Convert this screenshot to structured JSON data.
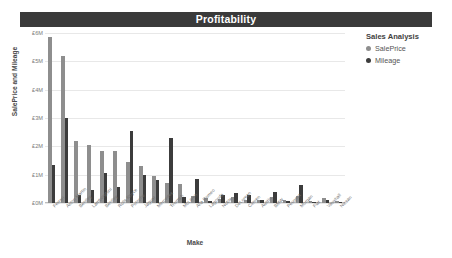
{
  "header": {
    "title": "Profitability",
    "bar_color": "#3a3a3a"
  },
  "legend": {
    "title": "Sales Analysis",
    "items": [
      {
        "label": "SalePrice",
        "color": "#8e8e8e",
        "marker": "circle-marker"
      },
      {
        "label": "Mileage",
        "color": "#3c3c3c",
        "marker": "circle-marker"
      }
    ]
  },
  "axes": {
    "x_title": "Make",
    "y_title": "SalePrice and Mileage",
    "y_ticks": [
      "£0M",
      "£1M",
      "£2M",
      "£3M",
      "£4M",
      "£5M",
      "£6M"
    ]
  },
  "chart_data": {
    "type": "bar",
    "title": "Profitability",
    "xlabel": "Make",
    "ylabel": "SalePrice and Mileage",
    "ylim": [
      0,
      6
    ],
    "y_tick_values": [
      0,
      1,
      2,
      3,
      4,
      5,
      6
    ],
    "y_tick_labels": [
      "£0M",
      "£1M",
      "£2M",
      "£3M",
      "£4M",
      "£5M",
      "£6M"
    ],
    "grid": true,
    "legend_position": "top-right",
    "legend_title": "Sales Analysis",
    "categories": [
      "Ferrari",
      "Aston Martin",
      "Bentley",
      "Lamborghini",
      "Bentley",
      "Rolls Royce",
      "Porsche",
      "Jaguar",
      "Mercedes",
      "Triumph",
      "McLaren",
      "Alfa Romeo",
      "Lagonda",
      "Noble",
      "DeLorean",
      "Citroen",
      "Austin",
      "BMW",
      "Peugeot",
      "Morgan",
      "Fiat",
      "Vauxhall",
      "Nissan"
    ],
    "series": [
      {
        "name": "SalePrice",
        "color": "#8e8e8e",
        "values": [
          5.85,
          5.2,
          2.2,
          2.05,
          1.85,
          1.85,
          1.45,
          1.3,
          0.95,
          0.72,
          0.68,
          0.24,
          0.16,
          0.15,
          0.2,
          0.12,
          0.1,
          0.22,
          0.1,
          0.23,
          0.08,
          0.16,
          0.07
        ]
      },
      {
        "name": "Mileage",
        "color": "#3c3c3c",
        "values": [
          1.35,
          3.0,
          0.3,
          0.45,
          1.05,
          0.55,
          2.55,
          1.0,
          0.82,
          2.3,
          0.2,
          0.85,
          0.08,
          0.3,
          0.35,
          0.28,
          0.1,
          0.4,
          0.08,
          0.65,
          0.05,
          0.1,
          0.03
        ]
      }
    ]
  }
}
